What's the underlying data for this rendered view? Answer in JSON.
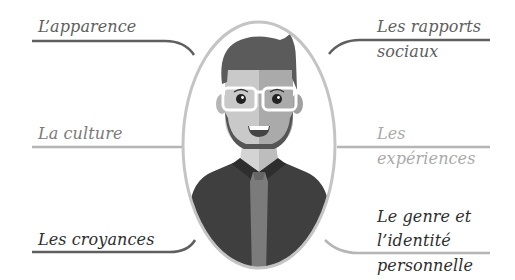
{
  "diagram": {
    "labels": {
      "top_left": "L’apparence",
      "mid_left": "La culture",
      "bottom_left": "Les croyances",
      "top_right_line1": "Les rapports",
      "top_right_line2": "sociaux",
      "mid_right_line1": "Les",
      "mid_right_line2": "expériences",
      "bottom_right_line1": "Le genre et",
      "bottom_right_line2": "l’identité",
      "bottom_right_line3": "personnelle"
    },
    "colors": {
      "connector_dark": "#5f5f5f",
      "connector_light": "#b5b5b5",
      "oval_border": "#c4c4c4",
      "hair": "#5b5b5b",
      "skin_light": "#c9c9c9",
      "skin_dark": "#aaaaaa",
      "jacket": "#3f3f3f",
      "tie": "#7b7b7b",
      "glasses": "#ffffff"
    }
  }
}
